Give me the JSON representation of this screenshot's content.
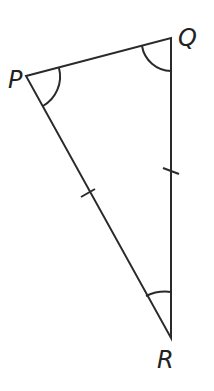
{
  "diagram": {
    "type": "triangle",
    "vertices": [
      {
        "label": "P",
        "x": 26,
        "y": 76
      },
      {
        "label": "Q",
        "x": 171,
        "y": 38
      },
      {
        "label": "R",
        "x": 171,
        "y": 338
      }
    ],
    "equal_sides": [
      "PR",
      "QR"
    ],
    "marked_angles": [
      "P",
      "Q",
      "R"
    ],
    "stroke_color": "#2a2a2a"
  }
}
